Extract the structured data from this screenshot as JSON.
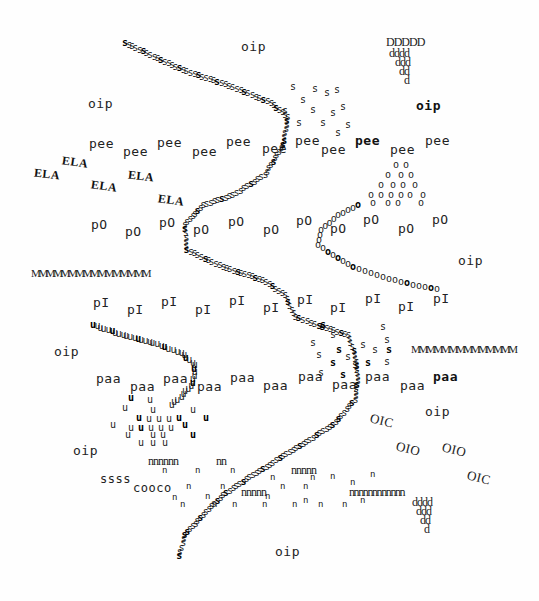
{
  "artwork": {
    "title": "Typewriter concrete poem",
    "ink_color": "#1a1a1a",
    "paper_color": "#fefefe"
  },
  "words": [
    {
      "text": "oip"
    },
    {
      "text": "oip"
    },
    {
      "text": "oip"
    },
    {
      "text": "oip"
    },
    {
      "text": "oip"
    },
    {
      "text": "oip"
    },
    {
      "text": "oip"
    },
    {
      "text": "oip"
    },
    {
      "text": "DDDDD"
    },
    {
      "text": "dddd"
    },
    {
      "text": "ddd"
    },
    {
      "text": "dd"
    },
    {
      "text": "d"
    },
    {
      "text": "pee"
    },
    {
      "text": "pee"
    },
    {
      "text": "pee"
    },
    {
      "text": "pee"
    },
    {
      "text": "pee"
    },
    {
      "text": "pee"
    },
    {
      "text": "pee"
    },
    {
      "text": "pee"
    },
    {
      "text": "pee"
    },
    {
      "text": "pee"
    },
    {
      "text": "ELA"
    },
    {
      "text": "ELA"
    },
    {
      "text": "ELA"
    },
    {
      "text": "ELA"
    },
    {
      "text": "ELA"
    },
    {
      "text": "pO"
    },
    {
      "text": "pO"
    },
    {
      "text": "pO"
    },
    {
      "text": "pO"
    },
    {
      "text": "pO"
    },
    {
      "text": "pO"
    },
    {
      "text": "pO"
    },
    {
      "text": "pO"
    },
    {
      "text": "pO"
    },
    {
      "text": "MMMMMMMMMMMMMMMM"
    },
    {
      "text": "pI"
    },
    {
      "text": "pI"
    },
    {
      "text": "pI"
    },
    {
      "text": "pI"
    },
    {
      "text": "pI"
    },
    {
      "text": "pI"
    },
    {
      "text": "pI"
    },
    {
      "text": "pI"
    },
    {
      "text": "pI"
    },
    {
      "text": "pI"
    },
    {
      "text": "MMMMMMMMMMMMMM"
    },
    {
      "text": "paa"
    },
    {
      "text": "paa"
    },
    {
      "text": "paa"
    },
    {
      "text": "paa"
    },
    {
      "text": "paa"
    },
    {
      "text": "paa"
    },
    {
      "text": "paa"
    },
    {
      "text": "paa"
    },
    {
      "text": "paa"
    },
    {
      "text": "paa"
    },
    {
      "text": "OIC"
    },
    {
      "text": "OIO"
    },
    {
      "text": "OIO"
    },
    {
      "text": "OIC"
    },
    {
      "text": "nnnnnn"
    },
    {
      "text": "nn"
    },
    {
      "text": "nnnnn"
    },
    {
      "text": "nnnnn"
    },
    {
      "text": "nnnnn"
    },
    {
      "text": "nnnnnnnnnnnn"
    },
    {
      "text": "ssss"
    },
    {
      "text": "cooco"
    },
    {
      "text": "dddd"
    },
    {
      "text": "ddd"
    },
    {
      "text": "dd"
    },
    {
      "text": "d"
    }
  ],
  "glyph_paths": {
    "s_path_char": "s",
    "o_path_char": "o",
    "u_path_char": "u",
    "s_cluster_char": "s",
    "o_cluster_char": "o",
    "u_cluster_char": "u",
    "n_scatter_char": "n"
  }
}
